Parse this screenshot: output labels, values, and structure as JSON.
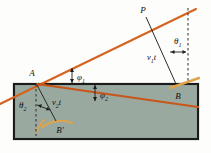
{
  "figure": {
    "type": "optics-refraction-huygens-construction",
    "colors": {
      "medium_fill": "#9aa99f",
      "medium_border": "#1b1b1b",
      "ray_orange": "#d4631f",
      "wavefront_tan": "#e0a34a",
      "construction_line": "#2a2a2a",
      "background": "#fdfdfc",
      "label_text": "#111111"
    },
    "labels": {
      "point_p": "P",
      "point_a": "A",
      "point_b": "B",
      "point_b_prime": "B'",
      "theta_1": "θ1",
      "theta_2": "θ2",
      "phi_1": "φ1",
      "phi_2": "φ2",
      "v1t": "v1t",
      "v2t": "v2t",
      "theta_base": "θ",
      "phi_base": "φ",
      "v_base": "v",
      "sub_1": "1",
      "sub_2": "2",
      "t_italic": "t",
      "prime": "′"
    },
    "geometry": {
      "block_left": 14,
      "block_top": 84,
      "block_right": 198,
      "block_bottom": 139,
      "point_a": [
        37,
        84
      ],
      "point_b": [
        176,
        84
      ],
      "point_p": [
        147,
        14
      ],
      "point_b_prime": [
        55,
        122
      ],
      "dashed_right_x": 188,
      "dashed_right_top": 8,
      "dashed_left_x": 36
    }
  }
}
